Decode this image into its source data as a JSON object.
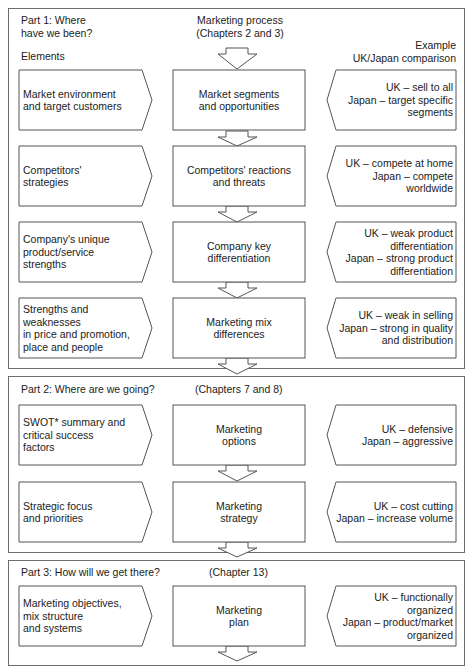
{
  "part1": {
    "title": "Part 1: Where\nhave we been?",
    "process_heading": "Marketing process\n(Chapters 2 and 3)",
    "elements_heading": "Elements",
    "example_heading": "Example\nUK/Japan comparison"
  },
  "part2": {
    "title": "Part 2: Where are we going?",
    "chapters": "(Chapters 7 and 8)"
  },
  "part3": {
    "title": "Part 3: How will we get there?",
    "chapters": "(Chapter 13)"
  },
  "rows": [
    {
      "element": "Market environment\nand target customers",
      "process": "Market segments\nand opportunities",
      "example": "UK – sell to all\nJapan – target specific\nsegments"
    },
    {
      "element": "Competitors'\nstrategies",
      "process": "Competitors' reactions\nand threats",
      "example": "UK – compete at home\nJapan – compete\nworldwide"
    },
    {
      "element": "Company's unique\nproduct/service\nstrengths",
      "process": "Company key\ndifferentiation",
      "example": "UK – weak product\ndifferentiation\nJapan – strong product\ndifferentiation"
    },
    {
      "element": "Strengths and weaknesses\nin price and promotion,\nplace and people",
      "process": "Marketing mix\ndifferences",
      "example": "UK – weak in selling\nJapan – strong in quality\nand distribution"
    },
    {
      "element": "SWOT* summary and\ncritical success\nfactors",
      "process": "Marketing\noptions",
      "example": "UK – defensive\nJapan – aggressive"
    },
    {
      "element": "Strategic focus\nand priorities",
      "process": "Marketing\nstrategy",
      "example": "UK – cost cutting\nJapan – increase volume"
    },
    {
      "element": "Marketing objectives,\nmix structure\nand systems",
      "process": "Marketing\nplan",
      "example": "UK – functionally\norganized\nJapan – product/market\norganized"
    }
  ],
  "colors": {
    "stroke": "#555555",
    "frame": "#6d6d6d",
    "text": "#222222"
  }
}
